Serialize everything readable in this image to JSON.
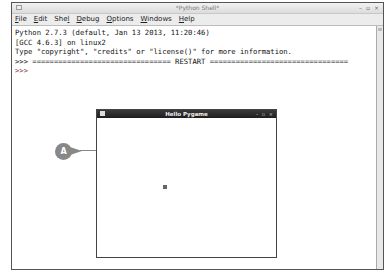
{
  "main_window": {
    "title": "*Python Shell*",
    "controls": "– ▫ ×",
    "menu": [
      {
        "label": "File",
        "mnemonic": "F",
        "rest": "ile"
      },
      {
        "label": "Edit",
        "mnemonic": "E",
        "rest": "dit"
      },
      {
        "label": "Shell",
        "pre": "She",
        "mnemonic": "l",
        "rest": "l"
      },
      {
        "label": "Debug",
        "mnemonic": "D",
        "rest": "ebug"
      },
      {
        "label": "Options",
        "mnemonic": "O",
        "rest": "ptions"
      },
      {
        "label": "Windows",
        "mnemonic": "W",
        "rest": "indows"
      },
      {
        "label": "Help",
        "mnemonic": "H",
        "rest": "elp"
      }
    ],
    "shell_lines": [
      "Python 2.7.3 (default, Jan 13 2013, 11:20:46)",
      "[GCC 4.6.3] on linux2",
      "Type \"copyright\", \"credits\" or \"license()\" for more information.",
      ">>> ================================ RESTART ================================",
      ">>> "
    ]
  },
  "pygame_window": {
    "title": "Hello Pygame",
    "controls": "– ▫ ×",
    "square": {
      "x": 66,
      "y": 75,
      "color": "#666666"
    }
  },
  "callout": {
    "label": "A",
    "color": "#888888"
  }
}
